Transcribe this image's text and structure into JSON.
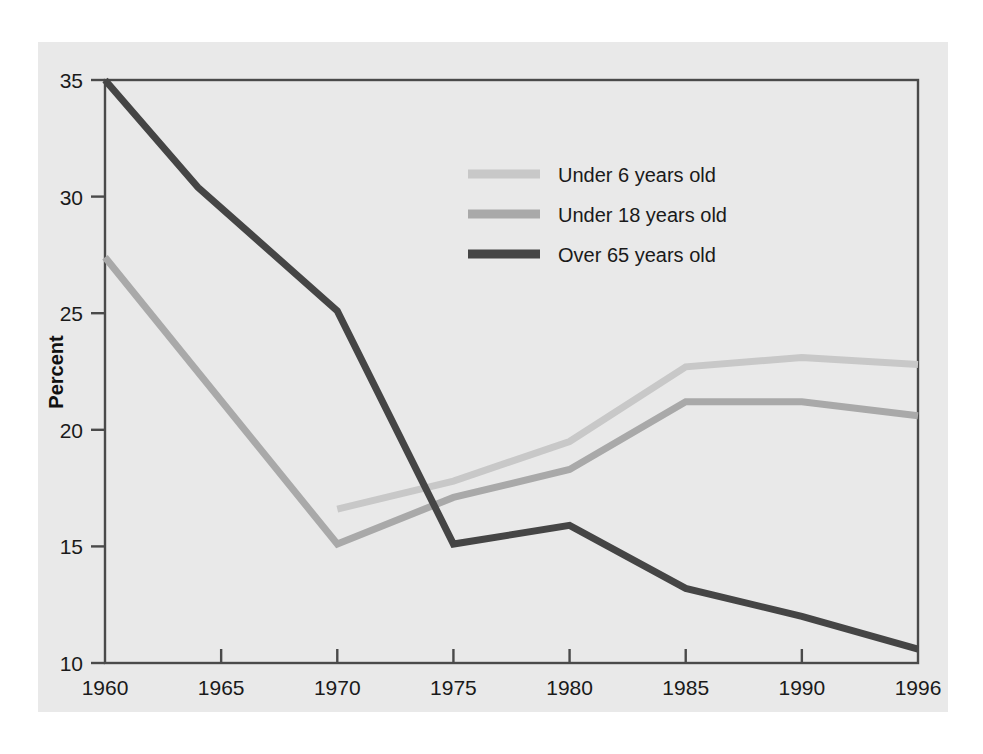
{
  "figure": {
    "background_color": "#ffffff",
    "panel_color": "#e9e9e9",
    "frame_color": "#4a4a4a"
  },
  "chart_data": {
    "type": "line",
    "title": "",
    "subtitle": "",
    "xlabel": "",
    "ylabel": "Percent",
    "x": [
      1960,
      1965,
      1970,
      1975,
      1980,
      1985,
      1990,
      1996
    ],
    "xtick_labels": [
      "1960",
      "1965",
      "1970",
      "1975",
      "1980",
      "1985",
      "1990",
      "1996"
    ],
    "ytick_labels": [
      "10",
      "15",
      "20",
      "25",
      "30",
      "35"
    ],
    "yticks": [
      10,
      15,
      20,
      25,
      30,
      35
    ],
    "xlim": [
      1960,
      1996
    ],
    "ylim": [
      10,
      35
    ],
    "grid": false,
    "legend_position": "upper-center-right inside plot",
    "series": [
      {
        "name": "Under 6 years old",
        "color": "#c8c8c8",
        "linewidth": 7,
        "points": [
          {
            "x": 1970,
            "y": 16.6
          },
          {
            "x": 1975,
            "y": 17.8
          },
          {
            "x": 1980,
            "y": 19.5
          },
          {
            "x": 1985,
            "y": 22.7
          },
          {
            "x": 1990,
            "y": 23.1
          },
          {
            "x": 1996,
            "y": 22.8
          }
        ]
      },
      {
        "name": "Under 18 years old",
        "color": "#a9a9a9",
        "linewidth": 7,
        "points": [
          {
            "x": 1960,
            "y": 27.4
          },
          {
            "x": 1970,
            "y": 15.1
          },
          {
            "x": 1975,
            "y": 17.1
          },
          {
            "x": 1980,
            "y": 18.3
          },
          {
            "x": 1985,
            "y": 21.2
          },
          {
            "x": 1990,
            "y": 21.2
          },
          {
            "x": 1996,
            "y": 20.6
          }
        ]
      },
      {
        "name": "Over 65 years old",
        "color": "#454545",
        "linewidth": 7,
        "points": [
          {
            "x": 1960,
            "y": 35.0
          },
          {
            "x": 1964,
            "y": 30.4
          },
          {
            "x": 1970,
            "y": 25.1
          },
          {
            "x": 1975,
            "y": 15.1
          },
          {
            "x": 1980,
            "y": 15.9
          },
          {
            "x": 1985,
            "y": 13.2
          },
          {
            "x": 1990,
            "y": 12.0
          },
          {
            "x": 1996,
            "y": 10.6
          }
        ]
      }
    ],
    "legend": [
      {
        "label": "Under 6 years old",
        "color": "#c8c8c8"
      },
      {
        "label": "Under 18 years old",
        "color": "#a9a9a9"
      },
      {
        "label": "Over 65 years old",
        "color": "#454545"
      }
    ]
  }
}
